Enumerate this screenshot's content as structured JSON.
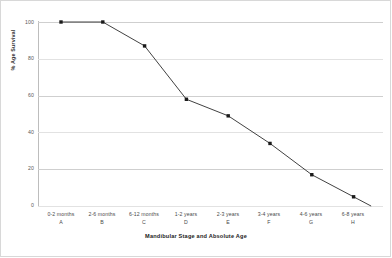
{
  "chart_data": {
    "type": "line",
    "title": "",
    "xlabel": "Mandibular Stage and Absolute Age",
    "ylabel": "% Age Survival",
    "categories": [
      "0-2 months",
      "2-6 months",
      "6-12 months",
      "1-2 years",
      "2-3 years",
      "3-4 years",
      "4-6 years",
      "6-8 years"
    ],
    "category_codes": [
      "A",
      "B",
      "C",
      "D",
      "E",
      "F",
      "G",
      "H"
    ],
    "values": [
      100,
      100,
      87,
      58,
      49,
      34,
      17,
      5
    ],
    "ylim": [
      0,
      100
    ],
    "yticks": [
      0,
      20,
      40,
      60,
      80,
      100
    ],
    "ytick_labels": [
      "0",
      "20",
      "40",
      "60",
      "80",
      "100"
    ],
    "grid": true,
    "legend": "none",
    "line_color": "#2b2b2b",
    "marker": "square",
    "marker_color": "#1a1a1a",
    "grid_color": "#e2e2e2",
    "background_color": "#ffffff"
  }
}
